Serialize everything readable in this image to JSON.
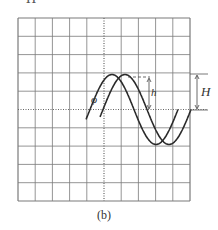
{
  "figure": {
    "caption": "(b)",
    "clipped_top_text": "H",
    "labels": {
      "phase": "φ",
      "small_height": "h",
      "large_height": "H"
    },
    "grid": {
      "columns": 10,
      "rows": 10,
      "left": 18,
      "top": 18,
      "right": 190,
      "bottom": 201
    },
    "colors": {
      "grid": "#7a7a7a",
      "curve": "#2a2a2a",
      "axis": "#666666"
    },
    "curves": [
      {
        "name": "waveform-1",
        "peak_x": 112,
        "period_px": 88,
        "amplitude_px": 35,
        "start_x": 86,
        "end_x": 178
      },
      {
        "name": "waveform-2",
        "peak_x": 125,
        "period_px": 88,
        "amplitude_px": 35,
        "start_x": 100,
        "end_x": 191
      }
    ]
  }
}
